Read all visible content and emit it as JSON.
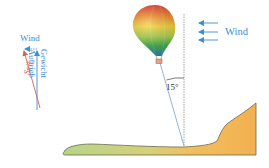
{
  "diagram": {
    "type": "physics-force-diagram",
    "labels": {
      "wind_main": "Wind",
      "wind_vector": "Wind",
      "rope": "Seil",
      "lift": "Auftrieb",
      "weight": "Gewicht",
      "angle": "15°"
    },
    "wind_arrows_count": 3,
    "colors": {
      "wind": "#3a8fd0",
      "rope_force": "#d9634a",
      "lift_force": "#3a8fd0",
      "rope_line": "#8aaabf",
      "vertical_reference": "#888888",
      "terrain_left": "#b5d48a",
      "terrain_right": "#f3b457",
      "terrain_outline": "#6b6b4a",
      "balloon_bands": [
        "#e53d2b",
        "#f28a2a",
        "#f5d53a",
        "#a8d24a",
        "#3fae4d",
        "#2a7fb8"
      ]
    }
  }
}
